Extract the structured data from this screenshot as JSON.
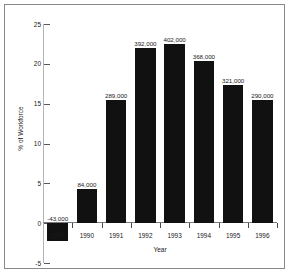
{
  "chart_data": {
    "type": "bar",
    "title": "",
    "subtitle": "",
    "xlabel": "Year",
    "ylabel": "% of Workforce",
    "categories": [
      "1989",
      "1990",
      "1991",
      "1992",
      "1993",
      "1994",
      "1995",
      "1996"
    ],
    "values": [
      -2.3,
      4.3,
      15.5,
      22.0,
      22.5,
      20.4,
      17.3,
      15.5
    ],
    "point_labels": [
      "-43,000",
      "84,000",
      "289,000",
      "392,000",
      "402,000",
      "368,000",
      "321,000",
      "290,000"
    ],
    "ylim": [
      -5,
      25
    ],
    "yticks": [
      25,
      20,
      15,
      10,
      5,
      0,
      -5
    ],
    "ytick_labels": [
      "25",
      "20",
      "15",
      "10",
      "5",
      "0",
      "-5"
    ],
    "grid": false,
    "legend": "none",
    "bar_color": "#111111",
    "axis_color": "#b4b4b4",
    "frame_color": "#8a8a8a",
    "text_color": "#1a1a1a"
  }
}
